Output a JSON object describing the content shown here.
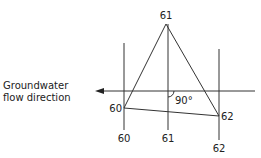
{
  "diagram": {
    "caption": {
      "line1": "Groundwater",
      "line2": "flow direction"
    },
    "points": [
      {
        "id": "well-60",
        "label": "60",
        "x": 124,
        "y": 108
      },
      {
        "id": "well-61",
        "label": "61",
        "x": 166,
        "y": 24
      },
      {
        "id": "well-62",
        "label": "62",
        "x": 219,
        "y": 116
      }
    ],
    "contours": [
      {
        "label": "60",
        "x": 124
      },
      {
        "label": "61",
        "x": 168
      },
      {
        "label": "62",
        "x": 219
      }
    ],
    "angle_label": "90°",
    "colors": {
      "line": "#333333",
      "text": "#222222",
      "background": "#ffffff"
    }
  }
}
